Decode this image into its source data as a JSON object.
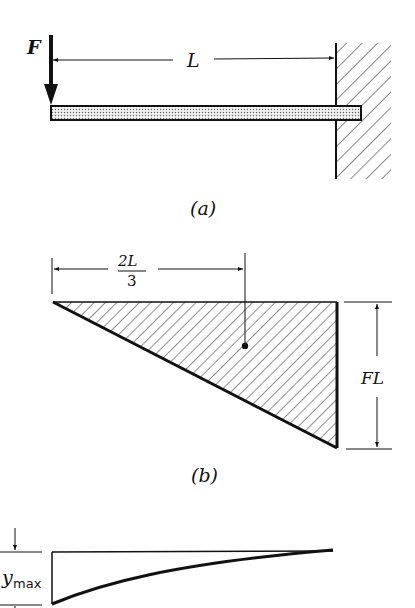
{
  "figure": {
    "panel_a": {
      "caption": "(a)",
      "force_label": "F",
      "length_label": "L",
      "description": "Cantilever beam fixed to wall at right, point load F at free left end"
    },
    "panel_b": {
      "caption": "(b)",
      "centroid_label_num": "2L",
      "centroid_label_den": "3",
      "height_label": "FL",
      "description": "Triangular bending-moment diagram with centroid at 2L/3 from free end"
    },
    "panel_c": {
      "deflection_label": "y",
      "deflection_subscript": "max",
      "description": "Deflected shape of cantilever with maximum deflection at free end"
    }
  },
  "colors": {
    "ink": "#111111",
    "background": "#ffffff",
    "beam_fill": "#d8d8d8"
  }
}
